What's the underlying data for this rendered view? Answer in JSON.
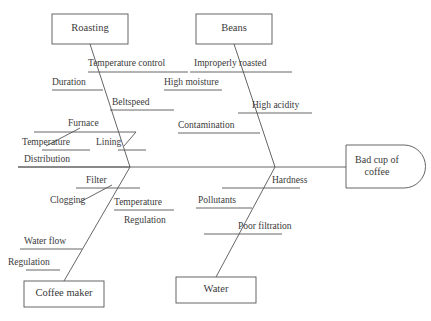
{
  "diagram": {
    "type": "fishbone-ishikawa",
    "stroke_color": "#555555",
    "text_color": "#3a3a3a",
    "background_color": "#ffffff",
    "effect": {
      "label": "Bad cup of\ncoffee",
      "line1": "Bad cup of",
      "line2": "coffee",
      "shape": "d-shape-rounded-right"
    },
    "categories": [
      {
        "name": "Roasting",
        "position": "top-left",
        "causes": [
          {
            "label": "Temperature control",
            "sub": []
          },
          {
            "label": "Duration",
            "sub": []
          },
          {
            "label": "Beltspeed",
            "sub": []
          },
          {
            "label": "Furnace",
            "sub": [
              {
                "label": "Temperature"
              }
            ]
          },
          {
            "label": "Lining",
            "sub": []
          },
          {
            "label": "Distribution",
            "sub": []
          }
        ]
      },
      {
        "name": "Beans",
        "position": "top-right",
        "causes": [
          {
            "label": "Improperly roasted",
            "sub": []
          },
          {
            "label": "High moisture",
            "sub": []
          },
          {
            "label": "High acidity",
            "sub": []
          },
          {
            "label": "Contamination",
            "sub": []
          }
        ]
      },
      {
        "name": "Coffee maker",
        "position": "bottom-left",
        "causes": [
          {
            "label": "Filter",
            "sub": [
              {
                "label": "Clogging"
              }
            ]
          },
          {
            "label": "Temperature",
            "sub": [
              {
                "label": "Regulation"
              }
            ]
          },
          {
            "label": "Water flow",
            "sub": [
              {
                "label": "Regulation"
              }
            ]
          }
        ]
      },
      {
        "name": "Water",
        "position": "bottom-right",
        "causes": [
          {
            "label": "Hardness",
            "sub": []
          },
          {
            "label": "Pollutants",
            "sub": []
          },
          {
            "label": "Poor filtration",
            "sub": []
          }
        ]
      }
    ],
    "labels": {
      "roasting": "Roasting",
      "beans": "Beans",
      "coffee_maker": "Coffee maker",
      "water": "Water",
      "temperature_control": "Temperature control",
      "duration": "Duration",
      "beltspeed": "Beltspeed",
      "furnace": "Furnace",
      "temperature_furnace": "Temperature",
      "lining": "Lining",
      "distribution": "Distribution",
      "improperly_roasted": "Improperly roasted",
      "high_moisture": "High moisture",
      "high_acidity": "High acidity",
      "contamination": "Contamination",
      "filter": "Filter",
      "clogging": "Clogging",
      "temperature_maker": "Temperature",
      "regulation_maker": "Regulation",
      "water_flow": "Water flow",
      "regulation_flow": "Regulation",
      "hardness": "Hardness",
      "pollutants": "Pollutants",
      "poor_filtration": "Poor filtration",
      "effect_line1": "Bad cup of",
      "effect_line2": "coffee"
    }
  }
}
